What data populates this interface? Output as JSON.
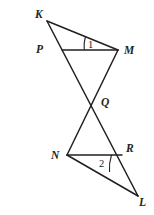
{
  "figure": {
    "background_color": "#ffffff",
    "stroke_color": "#231f20",
    "width": 154,
    "height": 215,
    "points": {
      "K": {
        "x": 47,
        "y": 21,
        "label": "K",
        "label_x": 35,
        "label_y": 18
      },
      "P": {
        "x": 62,
        "y": 50,
        "label": "P",
        "label_x": 36,
        "label_y": 53
      },
      "M": {
        "x": 118,
        "y": 50,
        "label": "M",
        "label_x": 124,
        "label_y": 54
      },
      "Q": {
        "x": 95,
        "y": 103,
        "label": "Q",
        "label_x": 101,
        "label_y": 105
      },
      "N": {
        "x": 67,
        "y": 155,
        "label": "N",
        "label_x": 52,
        "label_y": 159
      },
      "R": {
        "x": 122,
        "y": 155,
        "label": "R",
        "label_x": 126,
        "label_y": 152
      },
      "L": {
        "x": 138,
        "y": 196,
        "label": "L",
        "label_x": 140,
        "label_y": 205
      }
    },
    "segments": [
      {
        "name": "segment-KM",
        "from": "K",
        "to": "M"
      },
      {
        "name": "segment-KL",
        "from": "K",
        "to": "L"
      },
      {
        "name": "segment-PM",
        "from": "P",
        "to": "M"
      },
      {
        "name": "segment-MN",
        "from": "M",
        "to": "N"
      },
      {
        "name": "segment-NL",
        "from": "N",
        "to": "L"
      },
      {
        "name": "segment-NR",
        "from": "N",
        "to": "R"
      }
    ],
    "angles": [
      {
        "name": "angle-1",
        "label": "1",
        "vertex": "M",
        "label_x": 88,
        "label_y": 47
      },
      {
        "name": "angle-2",
        "label": "2",
        "vertex": "N",
        "label_x": 100,
        "label_y": 166
      }
    ]
  }
}
